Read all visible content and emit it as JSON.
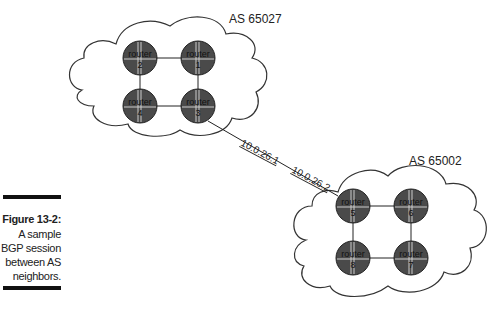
{
  "figure": {
    "caption_title": "Figure 13-2:",
    "caption_lines": [
      "A sample",
      "BGP session",
      "between AS",
      "neighbors."
    ]
  },
  "autonomous_systems": [
    {
      "label": "AS 65027",
      "routers": [
        {
          "label": "router",
          "number": "2",
          "cx": 140,
          "cy": 58
        },
        {
          "label": "router",
          "number": "1",
          "cx": 198,
          "cy": 58
        },
        {
          "label": "router",
          "number": "4",
          "cx": 140,
          "cy": 106
        },
        {
          "label": "router",
          "number": "3",
          "cx": 198,
          "cy": 106
        }
      ]
    },
    {
      "label": "AS 65002",
      "routers": [
        {
          "label": "router",
          "number": "5",
          "cx": 353,
          "cy": 206
        },
        {
          "label": "router",
          "number": "6",
          "cx": 411,
          "cy": 206
        },
        {
          "label": "router",
          "number": "8",
          "cx": 353,
          "cy": 258
        },
        {
          "label": "router",
          "number": "7",
          "cx": 411,
          "cy": 258
        }
      ]
    }
  ],
  "bgp_link": {
    "from": "router 3",
    "to": "router 5",
    "local_ip": "10.0.26.1",
    "remote_ip": "10.0.26.2"
  },
  "colors": {
    "router_fill": "#4a4a4a",
    "line": "#222222",
    "cloud_stroke": "#333333"
  }
}
